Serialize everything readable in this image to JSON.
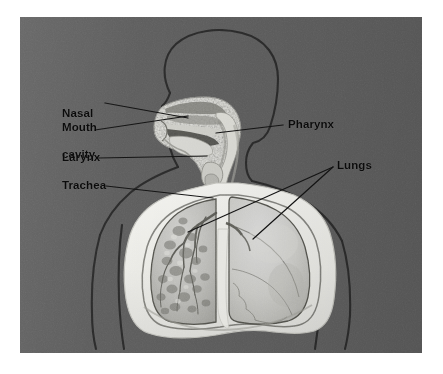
{
  "figure": {
    "kind": "anatomy-diagram",
    "panel_background_color": "#5d5d5d",
    "page_background_color": "#ffffff",
    "label_color": "#0b0b0b",
    "leader_line_color": "#141414",
    "tissue_light_color": "#e9e9e4",
    "tissue_mid_color": "#bdbdb8",
    "outline_color": "#2b2b2b"
  },
  "labels": {
    "nasal_cavity": "Nasal\ncavity",
    "nasal_cavity_line1": "Nasal",
    "nasal_cavity_line2": "cavity",
    "mouth": "Mouth",
    "larynx": "Larynx",
    "trachea": "Trachea",
    "pharynx": "Pharynx",
    "lungs": "Lungs"
  },
  "annotations": [
    {
      "id": "nasal-cavity",
      "text": "Nasal cavity",
      "side": "left",
      "text_x": 42,
      "text_y": 63,
      "leader_from": [
        105,
        86
      ],
      "leader_to": [
        168,
        101
      ]
    },
    {
      "id": "mouth",
      "text": "Mouth",
      "side": "left",
      "text_x": 42,
      "text_y": 104,
      "leader_from": [
        90,
        111
      ],
      "leader_to": [
        170,
        97
      ]
    },
    {
      "id": "larynx",
      "text": "Larynx",
      "side": "left",
      "text_x": 42,
      "text_y": 134,
      "leader_from": [
        92,
        141
      ],
      "leader_to": [
        186,
        139
      ]
    },
    {
      "id": "trachea",
      "text": "Trachea",
      "side": "left",
      "text_x": 42,
      "text_y": 162,
      "leader_from": [
        100,
        169
      ],
      "leader_to": [
        192,
        181
      ]
    },
    {
      "id": "pharynx",
      "text": "Pharynx",
      "side": "right",
      "text_x": 268,
      "text_y": 101,
      "leader_from": [
        262,
        108
      ],
      "leader_to": [
        192,
        115
      ]
    },
    {
      "id": "lungs-left",
      "text": "Lungs",
      "side": "right",
      "text_x": 317,
      "text_y": 142,
      "leader_from": [
        312,
        152
      ],
      "leader_to": [
        172,
        212
      ]
    },
    {
      "id": "lungs-right",
      "text": "Lungs",
      "side": "right",
      "text_x": 317,
      "text_y": 142,
      "leader_from": [
        312,
        152
      ],
      "leader_to": [
        232,
        220
      ]
    }
  ],
  "structures": [
    "head outline",
    "neck",
    "shoulders",
    "arms",
    "torso",
    "nasal cavity",
    "mouth",
    "tongue",
    "pharynx",
    "larynx",
    "trachea",
    "bronchi",
    "left lung",
    "right lung",
    "diaphragm"
  ]
}
